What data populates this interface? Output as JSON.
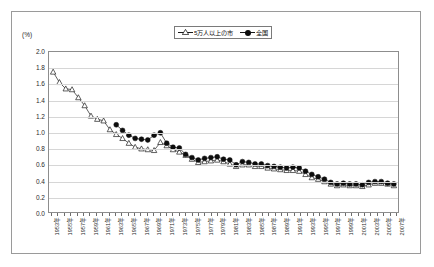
{
  "chart_data": {
    "type": "line",
    "title": "",
    "xlabel": "",
    "ylabel": "(%)",
    "ylim": [
      0.0,
      2.0
    ],
    "ytick_labels": [
      "2.0",
      "1.8",
      "1.6",
      "1.4",
      "1.2",
      "1.0",
      "0.8",
      "0.6",
      "0.4",
      "0.2",
      "0.0"
    ],
    "ytick_values": [
      2.0,
      1.8,
      1.6,
      1.4,
      1.2,
      1.0,
      0.8,
      0.6,
      0.4,
      0.2,
      0.0
    ],
    "grid": true,
    "legend_position": "top-center",
    "x": [
      1953,
      1954,
      1955,
      1956,
      1957,
      1958,
      1959,
      1960,
      1961,
      1962,
      1963,
      1964,
      1965,
      1966,
      1967,
      1968,
      1969,
      1970,
      1971,
      1972,
      1973,
      1974,
      1975,
      1976,
      1977,
      1978,
      1979,
      1980,
      1981,
      1982,
      1983,
      1984,
      1985,
      1986,
      1987,
      1988,
      1989,
      1990,
      1991,
      1992,
      1993,
      1994,
      1995,
      1996,
      1997,
      1998,
      1999,
      2000,
      2001,
      2002,
      2003,
      2004,
      2005,
      2006,
      2007
    ],
    "tick_labels": [
      "1953年",
      "",
      "1955年",
      "",
      "1957年",
      "",
      "1959年",
      "",
      "1961年",
      "",
      "1963年",
      "",
      "1965年",
      "",
      "1967年",
      "",
      "1969年",
      "",
      "1971年",
      "",
      "1973年",
      "",
      "1975年",
      "",
      "1977年",
      "",
      "1979年",
      "",
      "1981年",
      "",
      "1983年",
      "",
      "1985年",
      "",
      "1987年",
      "",
      "1989年",
      "",
      "1991年",
      "",
      "1993年",
      "",
      "1995年",
      "",
      "1997年",
      "",
      "1999年",
      "",
      "2001年",
      "",
      "2003年",
      "",
      "2005年",
      "",
      "2007年"
    ],
    "series": [
      {
        "name": "5万人以上の市",
        "marker": "open-triangle",
        "color": "#1a1a1a",
        "values": [
          1.75,
          1.62,
          1.54,
          1.53,
          1.43,
          1.33,
          1.2,
          1.16,
          1.14,
          1.03,
          0.97,
          0.92,
          0.86,
          0.81,
          0.79,
          0.78,
          0.77,
          0.87,
          0.83,
          0.78,
          0.75,
          0.71,
          0.66,
          0.62,
          0.63,
          0.64,
          0.65,
          0.63,
          0.6,
          0.57,
          0.59,
          0.59,
          0.57,
          0.57,
          0.55,
          0.54,
          0.53,
          0.52,
          0.52,
          0.51,
          0.47,
          0.43,
          0.41,
          0.38,
          0.35,
          0.33,
          0.34,
          0.33,
          0.33,
          0.32,
          0.34,
          0.36,
          0.36,
          0.35,
          0.33
        ]
      },
      {
        "name": "全国",
        "marker": "filled-circle",
        "color": "#0d0d0d",
        "values": [
          null,
          null,
          null,
          null,
          null,
          null,
          null,
          null,
          null,
          null,
          1.09,
          1.02,
          0.96,
          0.92,
          0.91,
          0.9,
          0.96,
          0.99,
          0.86,
          0.81,
          0.8,
          0.72,
          0.68,
          0.65,
          0.67,
          0.68,
          0.69,
          0.66,
          0.65,
          0.59,
          0.63,
          0.62,
          0.6,
          0.6,
          0.58,
          0.57,
          0.56,
          0.55,
          0.56,
          0.55,
          0.51,
          0.47,
          0.44,
          0.41,
          0.37,
          0.35,
          0.36,
          0.35,
          0.35,
          0.34,
          0.37,
          0.38,
          0.38,
          0.36,
          0.35
        ]
      }
    ]
  },
  "legend": {
    "items": [
      {
        "label": "5万人以上の市",
        "marker": "open-triangle"
      },
      {
        "label": "全国",
        "marker": "filled-circle"
      }
    ]
  },
  "axis": {
    "y_unit_label": "(%)"
  }
}
